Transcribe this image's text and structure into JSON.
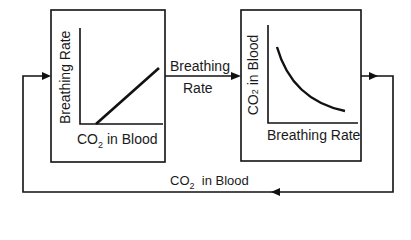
{
  "diagram": {
    "type": "feedback-loop",
    "left_box": {
      "y_axis_label": "Breathing Rate",
      "x_axis_label_prefix": "CO",
      "x_axis_label_sub": "2",
      "x_axis_label_suffix": "in Blood",
      "relationship": "linear increasing"
    },
    "right_box": {
      "y_axis_label_prefix": "CO",
      "y_axis_label_sub": "2",
      "y_axis_label_suffix": " in Blood",
      "x_axis_label": "Breathing Rate",
      "relationship": "decreasing curve"
    },
    "middle_arrow": {
      "line1": "Breathing",
      "line2": "Rate"
    },
    "bottom_arrow": {
      "prefix": "CO",
      "sub": "2",
      "suffix": "in Blood"
    },
    "colors": {
      "stroke": "#111111",
      "background": "#ffffff"
    }
  }
}
